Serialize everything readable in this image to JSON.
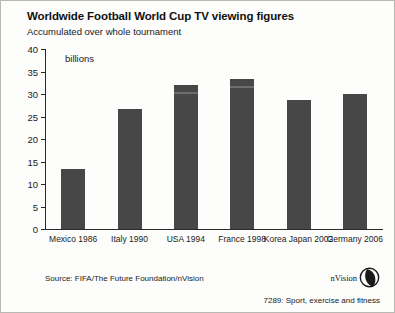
{
  "chart_data": {
    "type": "bar",
    "title": "Worldwide Football World Cup TV viewing figures",
    "subtitle": "Accumulated over whole tournament",
    "unit_label": "billions",
    "xlabel": "",
    "ylabel": "billions",
    "categories": [
      "Mexico 1986",
      "Italy 1990",
      "USA 1994",
      "France 1998",
      "Korea Japan 2002",
      "Germany 2006"
    ],
    "values": [
      13.3,
      26.7,
      32.0,
      33.3,
      28.7,
      30.0
    ],
    "ylim": [
      0,
      40
    ],
    "yticks": [
      0,
      5,
      10,
      15,
      20,
      25,
      30,
      35,
      40
    ],
    "ytick_labels": [
      "0",
      "5",
      "10",
      "15",
      "20",
      "25",
      "30",
      "35",
      "40"
    ],
    "grid": false,
    "legend": false,
    "bar_color": "#474747"
  },
  "footer": {
    "source": "Source: FIFA/The Future Foundation/nVision",
    "code": "7289: Sport, exercise and fitness",
    "brand": "nVision"
  }
}
